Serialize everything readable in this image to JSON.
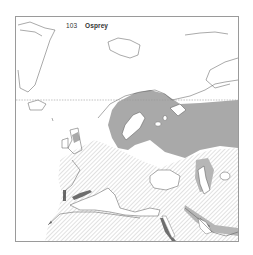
{
  "map": {
    "title_number": "103",
    "title_name": "Osprey",
    "legend_colors": {
      "breeding_range": "#a9a9a9",
      "migration_hatch": "#cfcfcf",
      "wintering_dark": "#6e6e6e",
      "coastline": "#555555",
      "frame": "#9a9a9a",
      "arctic_circle_dash": "#999999"
    },
    "regions": [
      "Greenland",
      "Svalbard",
      "Franz Josef Land",
      "Novaya Zemlya",
      "Iceland",
      "British Isles",
      "Scandinavia",
      "Finland",
      "European Russia",
      "Western Europe",
      "Iberia",
      "Italy",
      "Black Sea",
      "Caspian Sea",
      "North Africa",
      "Egypt / Nile",
      "Red Sea",
      "Arabia"
    ]
  }
}
